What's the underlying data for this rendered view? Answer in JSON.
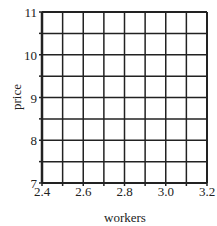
{
  "chart_data": {
    "type": "line",
    "title": "",
    "xlabel": "workers",
    "ylabel": "price",
    "xlim": [
      2.4,
      3.2
    ],
    "ylim": [
      7,
      11
    ],
    "x_ticks": [
      2.4,
      2.5,
      2.6,
      2.7,
      2.8,
      2.9,
      3.0,
      3.1,
      3.2
    ],
    "x_tick_labels": [
      "2.4",
      "",
      "2.6",
      "",
      "2.8",
      "",
      "3.0",
      "",
      "3.2"
    ],
    "y_ticks": [
      7,
      7.5,
      8,
      8.5,
      9,
      9.5,
      10,
      10.5,
      11
    ],
    "y_tick_labels": [
      "7",
      "",
      "8",
      "",
      "9",
      "",
      "10",
      "",
      "11"
    ],
    "grid": true,
    "series": [],
    "legend": null
  },
  "style": {
    "grid_color": "#222222",
    "background": "#ffffff"
  }
}
